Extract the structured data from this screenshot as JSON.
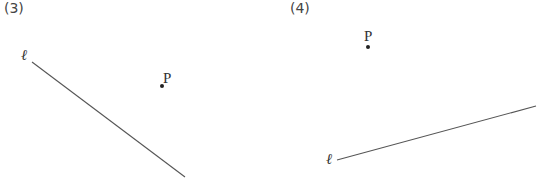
{
  "panels": [
    {
      "label": "(3)",
      "line": {
        "label": "ℓ",
        "x1": 32,
        "y1": 62,
        "x2": 185,
        "y2": 177
      },
      "point": {
        "label": "P",
        "x": 162,
        "y": 86
      }
    },
    {
      "label": "(4)",
      "line": {
        "label": "ℓ",
        "x1": 337,
        "y1": 160,
        "x2": 536,
        "y2": 106
      },
      "point": {
        "label": "P",
        "x": 368,
        "y": 47
      }
    }
  ],
  "colors": {
    "stroke": "#555555",
    "text": "#333333"
  }
}
